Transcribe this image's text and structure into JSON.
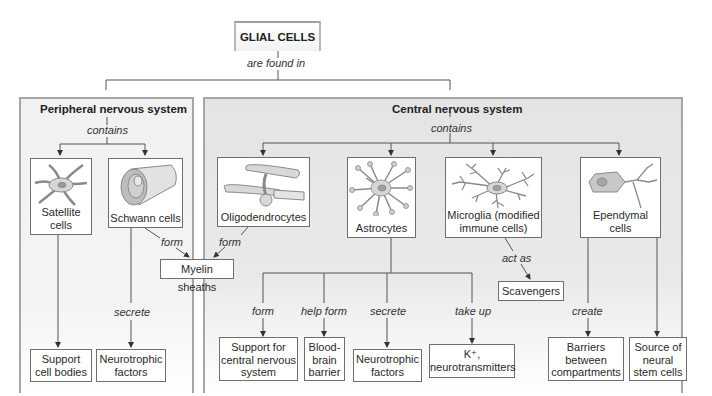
{
  "root": {
    "title": "GLIAL CELLS",
    "relation": "are found in"
  },
  "pns": {
    "title": "Peripheral nervous system",
    "relation": "contains",
    "cells": [
      {
        "name_line1": "Satellite",
        "name_line2": "cells"
      },
      {
        "name_line1": "Schwann cells"
      }
    ],
    "satellite_relation": "",
    "satellite_target": {
      "line1": "Support",
      "line2": "cell bodies"
    },
    "schwann_relation_form": "form",
    "schwann_relation_secrete": "secrete",
    "schwann_target": {
      "line1": "Neurotrophic",
      "line2": "factors"
    }
  },
  "shared": {
    "myelin_sheaths": "Myelin sheaths"
  },
  "cns": {
    "title": "Central nervous system",
    "relation": "contains",
    "cells": [
      {
        "name_line1": "Oligodendrocytes"
      },
      {
        "name_line1": "Astrocytes"
      },
      {
        "name_line1": "Microglia (modified",
        "name_line2": "immune cells)"
      },
      {
        "name_line1": "Ependymal",
        "name_line2": "cells"
      }
    ],
    "oligo_relation": "form",
    "astrocyte_branches": [
      {
        "relation": "form",
        "target_lines": [
          "Support for",
          "central nervous",
          "system"
        ]
      },
      {
        "relation": "help form",
        "target_lines": [
          "Blood-",
          "brain",
          "barrier"
        ]
      },
      {
        "relation": "secrete",
        "target_lines": [
          "Neurotrophic",
          "factors"
        ]
      },
      {
        "relation": "take up",
        "target_lines": [
          "K⁺,",
          "neurotransmitters"
        ]
      }
    ],
    "microglia_relation": "act as",
    "microglia_target": "Scavengers",
    "ependymal_relation": "create",
    "ependymal_targets": [
      {
        "lines": [
          "Barriers",
          "between",
          "compartments"
        ]
      },
      {
        "lines": [
          "Source of",
          "neural",
          "stem cells"
        ]
      }
    ]
  },
  "colors": {
    "pns_panel": "#f1f1f1",
    "cns_panel": "#e4e4e4",
    "panel_border": "#a6a6a6",
    "box_border": "#6f6f6f",
    "line": "#555555",
    "cell_fill": "#d8d8d8",
    "cell_stroke": "#8a8a8a"
  }
}
